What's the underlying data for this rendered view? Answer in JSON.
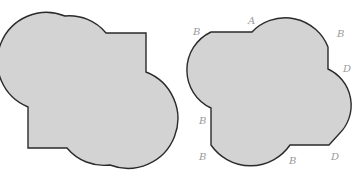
{
  "figure": {
    "colors": {
      "fill": "#d3d3d3",
      "stroke": "#2a2a2a",
      "label": "#9a9a9a",
      "background": "#ffffff"
    },
    "left_shape": {
      "name": "left-composite-shape"
    },
    "right_shape": {
      "name": "right-composite-shape",
      "labels": [
        {
          "text": "B",
          "x": 193,
          "y": 35
        },
        {
          "text": "A",
          "x": 248,
          "y": 24
        },
        {
          "text": "B",
          "x": 337,
          "y": 37
        },
        {
          "text": "D",
          "x": 343,
          "y": 72
        },
        {
          "text": "B",
          "x": 199,
          "y": 124
        },
        {
          "text": "B",
          "x": 199,
          "y": 160
        },
        {
          "text": "B",
          "x": 289,
          "y": 164
        },
        {
          "text": "D",
          "x": 331,
          "y": 160
        }
      ]
    }
  }
}
